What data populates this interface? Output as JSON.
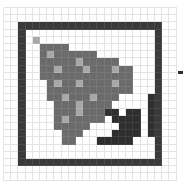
{
  "editor": {
    "type": "pixel-icon-editor",
    "columns": 24,
    "rows": 24,
    "palette": {
      "0": "#ffffff",
      "1": "#3a3a3a",
      "2": "#6b6b6b",
      "3": "#a8a8a8",
      "4": "#2e2e2e"
    },
    "grid_line_color": "#e4e4e4",
    "pixels": [
      "000000000000000000000000",
      "000000000000000000000000",
      "001111111111111111111100",
      "001000000000000000000100",
      "001030000000000000000100",
      "001002222000000000000100",
      "001002322222200000000100",
      "001002222232222200000100",
      "001002232223222322000100",
      "001002222222222222000100",
      "001000232232222322000100",
      "001000222222222222000100",
      "001000223222322200004100",
      "001000022232222000004100",
      "001000022232224404404100",
      "001000023222220444404100",
      "001000022222000044404100",
      "001000002220000444404100",
      "001000002200044444000100",
      "001000000000000000000100",
      "001000000000000000000100",
      "001111111111111111111100",
      "000000000000000000000000",
      "000000000000000000000000"
    ]
  },
  "edge_marker": {
    "color": "#2e2e2e"
  }
}
